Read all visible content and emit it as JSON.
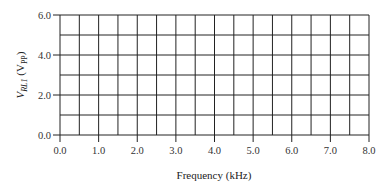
{
  "chart_data": {
    "type": "line",
    "title": "",
    "xlabel": "Frequency (kHz)",
    "ylabel": "V_RL1 (V_PP)",
    "ylabel_parts": {
      "main": "V",
      "main_sub": "RL1",
      "paren_open": " (V",
      "unit_sub": "PP",
      "paren_close": ")"
    },
    "xlim": [
      0.0,
      8.0
    ],
    "ylim": [
      0.0,
      6.0
    ],
    "x_ticks": [
      "0.0",
      "1.0",
      "2.0",
      "3.0",
      "4.0",
      "5.0",
      "6.0",
      "7.0",
      "8.0"
    ],
    "y_ticks": [
      "0.0",
      "2.0",
      "4.0",
      "6.0"
    ],
    "grid": true,
    "x_grid_step": 0.5,
    "y_grid_step": 1.0,
    "series": [],
    "note": "Blank graph grid for plotting data"
  }
}
